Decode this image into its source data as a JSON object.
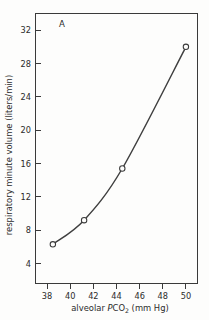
{
  "figure": {
    "panel_label": "A",
    "background_color": "#fdfdfc",
    "ink_color": "#3a3a3a"
  },
  "chart_data": {
    "type": "line",
    "title": "",
    "subtitle": "",
    "panel": "A",
    "xlabel_parts": {
      "lead": "alveolar ",
      "italic": "P",
      "species": "CO",
      "subscript": "2",
      "units": " (mm Hg)"
    },
    "xlabel": "alveolar PCO2 (mm Hg)",
    "ylabel": "respiratory minute volume (liters/min)",
    "xlim": [
      37.0,
      51.0
    ],
    "ylim": [
      1.6,
      34.0
    ],
    "xticks": [
      38,
      40,
      42,
      44,
      46,
      48,
      50
    ],
    "yticks": [
      4,
      8,
      12,
      16,
      20,
      24,
      28,
      32
    ],
    "xticklabels": [
      "38",
      "40",
      "42",
      "44",
      "46",
      "48",
      "50"
    ],
    "yticklabels": [
      "4",
      "8",
      "12",
      "16",
      "20",
      "24",
      "28",
      "32"
    ],
    "grid": false,
    "legend": false,
    "legend_position": "none",
    "marker": "open-circle",
    "series": [
      {
        "name": "respiratory minute volume",
        "x": [
          38.5,
          41.2,
          44.5,
          50.0
        ],
        "y": [
          6.3,
          9.2,
          15.4,
          30.0
        ]
      }
    ]
  }
}
